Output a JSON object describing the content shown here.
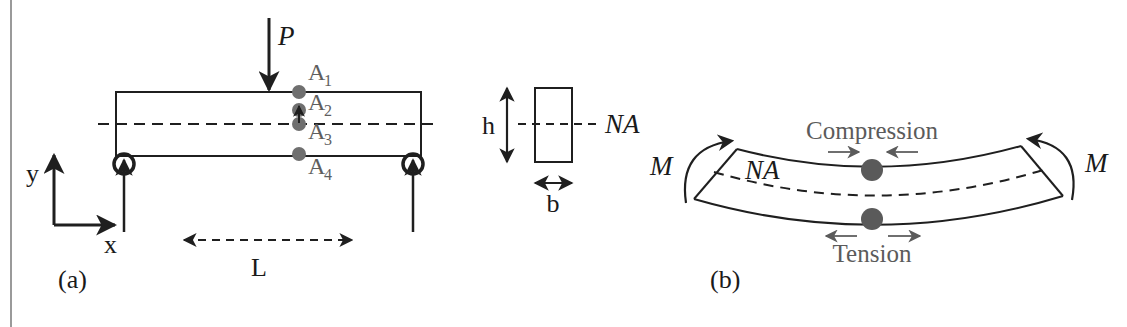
{
  "figure": {
    "panels": [
      {
        "id": "a",
        "caption": "(a)",
        "description": "Simply supported beam with central point load"
      },
      {
        "id": "b",
        "caption": "(b)",
        "description": "Beam segment in pure bending with end moments"
      }
    ]
  },
  "panel_a": {
    "caption": "(a)",
    "load_label": "P",
    "axis_y_label": "y",
    "axis_x_label": "x",
    "span_label": "L",
    "points": [
      {
        "name": "A",
        "sub": "1",
        "label": "A₁"
      },
      {
        "name": "A",
        "sub": "2",
        "label": "A₂"
      },
      {
        "name": "A",
        "sub": "3",
        "label": "A₃"
      },
      {
        "name": "A",
        "sub": "4",
        "label": "A₄"
      }
    ]
  },
  "panel_section": {
    "height_label": "h",
    "width_label": "b",
    "neutral_axis_label": "NA"
  },
  "panel_b": {
    "caption": "(b)",
    "moment_left_label": "M",
    "moment_right_label": "M",
    "neutral_axis_label": "NA",
    "compression_label": "Compression",
    "tension_label": "Tension"
  },
  "colors": {
    "line": "#1f1f1f",
    "marker_gray": "#6f6f6f",
    "marker_dark": "#5a5a5a",
    "stress_text": "#5b5b5b",
    "border_rule": "#9a9a9a",
    "background": "#ffffff"
  }
}
